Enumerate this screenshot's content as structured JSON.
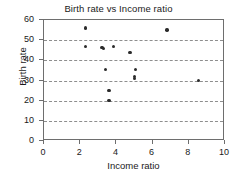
{
  "chart_data": {
    "type": "scatter",
    "title": "Birth rate vs Income ratio",
    "xlabel": "Income ratio",
    "ylabel": "Birth rate",
    "xlim": [
      0,
      10
    ],
    "ylim": [
      0,
      60
    ],
    "xticks": [
      0,
      2,
      4,
      6,
      8,
      10
    ],
    "yticks": [
      0,
      10,
      20,
      30,
      40,
      50,
      60
    ],
    "grid": "horizontal-dashed",
    "legend": null,
    "marker": {
      "shape": "circle",
      "color": "#2b2b2b",
      "size": 3.4
    },
    "points": [
      {
        "x": 2.3,
        "y": 56
      },
      {
        "x": 2.3,
        "y": 47
      },
      {
        "x": 3.2,
        "y": 46.5
      },
      {
        "x": 3.3,
        "y": 46
      },
      {
        "x": 3.85,
        "y": 47
      },
      {
        "x": 3.4,
        "y": 35.5
      },
      {
        "x": 3.6,
        "y": 25
      },
      {
        "x": 3.6,
        "y": 20
      },
      {
        "x": 4.75,
        "y": 44
      },
      {
        "x": 5.0,
        "y": 32
      },
      {
        "x": 5.05,
        "y": 35.5
      },
      {
        "x": 5.0,
        "y": 31
      },
      {
        "x": 6.8,
        "y": 55
      },
      {
        "x": 8.55,
        "y": 30
      }
    ]
  }
}
